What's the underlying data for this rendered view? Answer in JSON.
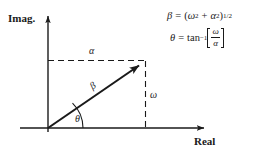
{
  "figure": {
    "background_color": "#ffffff",
    "line_color": "#1a1a1a",
    "axes": {
      "imaginary_label": "Imag.",
      "real_label": "Real"
    },
    "labels": {
      "alpha": "α",
      "beta": "β",
      "omega": "ω",
      "theta": "θ"
    },
    "equations": {
      "magnitude": {
        "lhs": "β",
        "equals": "=",
        "open_paren": "(",
        "omega": "ω",
        "omega_exp": "2",
        "plus": "+",
        "alpha": "α",
        "alpha_exp": "2",
        "close_paren": ")",
        "exponent": "1/2",
        "plain": "β = (ω² + α²)^(1/2)"
      },
      "angle": {
        "lhs": "θ",
        "equals": "=",
        "func": "tan",
        "func_exp": "−1",
        "numerator": "ω",
        "denominator": "α",
        "plain": "θ = tan⁻¹[ω/α]"
      }
    },
    "geometry": {
      "origin": {
        "x": 48,
        "y": 128
      },
      "vector_tip": {
        "x": 145,
        "y": 61
      },
      "real_axis_end": {
        "x": 208,
        "y": 128
      },
      "imag_axis_top": {
        "x": 48,
        "y": 12
      }
    }
  }
}
